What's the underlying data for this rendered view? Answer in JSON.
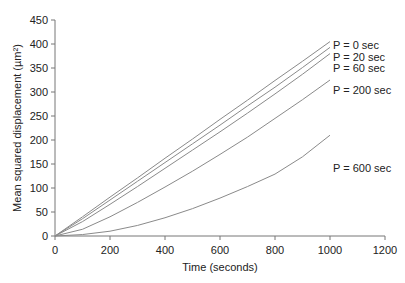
{
  "chart_data": {
    "type": "line",
    "title": "",
    "xlabel": "Time (seconds)",
    "ylabel": "Mean squared displacement (µm²)",
    "xlim": [
      0,
      1200
    ],
    "ylim": [
      0,
      450
    ],
    "xticks": [
      0,
      200,
      400,
      600,
      800,
      1000,
      1200
    ],
    "yticks": [
      0,
      50,
      100,
      150,
      200,
      250,
      300,
      350,
      400,
      450
    ],
    "grid": false,
    "legend_position": "inline labels at line ends",
    "x": [
      0,
      100,
      200,
      300,
      400,
      500,
      600,
      700,
      800,
      900,
      1000
    ],
    "series": [
      {
        "name": "P = 0 sec",
        "values": [
          0,
          40,
          81,
          121,
          162,
          202,
          243,
          283,
          324,
          364,
          405
        ]
      },
      {
        "name": "P = 20 sec",
        "values": [
          0,
          36,
          75,
          114,
          153,
          192,
          231,
          271,
          310,
          351,
          393
        ]
      },
      {
        "name": "P = 60 sec",
        "values": [
          0,
          30,
          66,
          103,
          141,
          179,
          217,
          256,
          296,
          337,
          380
        ]
      },
      {
        "name": "P = 200 sec",
        "values": [
          0,
          14,
          40,
          70,
          102,
          135,
          170,
          206,
          245,
          284,
          325
        ]
      },
      {
        "name": "P = 600 sec",
        "values": [
          0,
          3,
          10,
          22,
          38,
          57,
          79,
          103,
          129,
          165,
          210
        ]
      }
    ]
  },
  "colors": {
    "line": "#8a8a8a",
    "axis": "#777777",
    "text": "#222222"
  }
}
